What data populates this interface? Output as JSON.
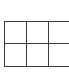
{
  "table": {
    "rows": 2,
    "columns": 3,
    "cells": [
      [
        "",
        "",
        ""
      ],
      [
        "",
        "",
        ""
      ]
    ],
    "line_color": "#3a3a3a",
    "background": "#ffffff"
  },
  "header": {
    "text": ""
  }
}
